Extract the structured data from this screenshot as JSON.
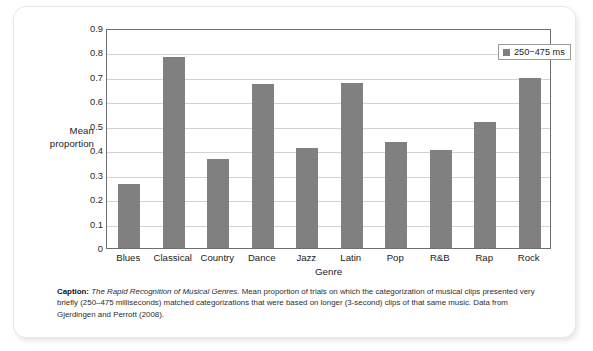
{
  "chart_data": {
    "type": "bar",
    "title": "",
    "xlabel": "Genre",
    "ylabel": "Mean proportion",
    "ylim": [
      0,
      0.9
    ],
    "ytick_labels": [
      "0.9",
      "0.8",
      "0.7",
      "0.6",
      "0.5",
      "0.4",
      "0.3",
      "0.2",
      "0.1",
      "0"
    ],
    "yticks": [
      0.9,
      0.8,
      0.7,
      0.6,
      0.5,
      0.4,
      0.3,
      0.2,
      0.1,
      0
    ],
    "grid": true,
    "legend_position": "top-right",
    "categories": [
      "Blues",
      "Classical",
      "Country",
      "Dance",
      "Jazz",
      "Latin",
      "Pop",
      "R&B",
      "Rap",
      "Rock"
    ],
    "series": [
      {
        "name": "250−475 ms",
        "color": "#808080",
        "values": [
          0.26,
          0.78,
          0.365,
          0.67,
          0.41,
          0.675,
          0.435,
          0.4,
          0.515,
          0.695
        ]
      }
    ]
  },
  "legend": {
    "entry_label": "250−475 ms",
    "swatch_color": "#808080"
  },
  "axis": {
    "y_title_line1": "Mean",
    "y_title_line2": "proportion",
    "x_title": "Genre"
  },
  "caption": {
    "label": "Caption:",
    "title": "The Rapid Recognition of Musical Genres.",
    "body": " Mean proportion of trials on which the categorization of musical clips presented very briefly (250–475 milliseconds) matched categorizations that were based on longer (3-second) clips of that same music. Data from Gjerdingen and Perrott (2008)."
  },
  "colors": {
    "bar": "#808080",
    "gridline": "#d2d2d2",
    "axis": "#6f6f6f",
    "card_background": "#ffffff"
  }
}
